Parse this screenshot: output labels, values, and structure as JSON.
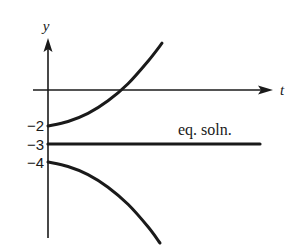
{
  "chart_data": {
    "type": "line",
    "title": "",
    "xlabel": "t",
    "ylabel": "y",
    "grid": false,
    "legend": "none",
    "y_tick_labels": [
      "-2",
      "-3",
      "-4"
    ],
    "y_ticks": [
      -2,
      -3,
      -4
    ],
    "ylim": [
      -7,
      2
    ],
    "xlim": [
      0,
      6
    ],
    "series": [
      {
        "name": "solution from y0 = -2",
        "kind": "curve",
        "description": "increases away from equilibrium",
        "points": [
          [
            0,
            -2
          ],
          [
            1,
            -1.75
          ],
          [
            2,
            -1.3
          ],
          [
            3,
            -0.6
          ],
          [
            4,
            0.35
          ],
          [
            5,
            1.6
          ],
          [
            5.7,
            2.6
          ]
        ]
      },
      {
        "name": "equilibrium solution y = -3",
        "kind": "horizontal-line",
        "points": [
          [
            0,
            -3
          ],
          [
            11,
            -3
          ]
        ]
      },
      {
        "name": "solution from y0 = -4",
        "kind": "curve",
        "description": "decreases away from equilibrium",
        "points": [
          [
            0,
            -4
          ],
          [
            1,
            -4.25
          ],
          [
            2,
            -4.7
          ],
          [
            3,
            -5.4
          ],
          [
            4,
            -6.35
          ],
          [
            5,
            -7.6
          ],
          [
            5.6,
            -8.5
          ]
        ]
      }
    ],
    "annotations": [
      {
        "text": "eq. soln.",
        "x": 7.6,
        "y": -2.6
      }
    ],
    "colors": {
      "ink": "#1a1a1a",
      "background": "#ffffff"
    }
  }
}
